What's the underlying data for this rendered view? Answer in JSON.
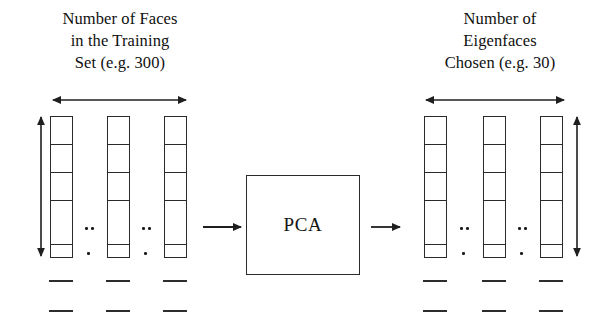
{
  "diagram": {
    "title_left": "Number of Faces in the Training Set (e.g. 300)",
    "title_right": "Number of Eigenfaces Chosen (e.g. 30)",
    "process_label": "PCA",
    "stroke_color": "#2a2a2a",
    "background_color": "#ffffff"
  },
  "caption_left": {
    "line1": "Number of Faces",
    "line2": "in the Training",
    "line3": "Set (e.g. 300)"
  },
  "caption_right": {
    "line1": "Number of",
    "line2": "Eigenfaces",
    "line3": "Chosen (e.g. 30)"
  },
  "pca": {
    "label": "PCA"
  },
  "left_group": {
    "horizontal_arrow_label": "number-of-faces-extent",
    "vertical_arrow_label": "image-vector-length-extent",
    "columns": [
      {
        "name": "face-vector-1",
        "cells": 5
      },
      {
        "name": "face-vector-2",
        "cells": 5
      },
      {
        "name": "face-vector-n",
        "cells": 5
      }
    ],
    "ellipsis_groups": [
      {
        "name": "ellipsis-left-1",
        "double": "..",
        "single": "."
      },
      {
        "name": "ellipsis-left-2",
        "double": "..",
        "single": "."
      }
    ],
    "dash_rows": 2,
    "dashes_per_row": 3
  },
  "right_group": {
    "horizontal_arrow_label": "number-of-eigenfaces-extent",
    "vertical_arrow_label": "eigenvector-length-extent",
    "columns": [
      {
        "name": "eigenface-vector-1",
        "cells": 5
      },
      {
        "name": "eigenface-vector-2",
        "cells": 5
      },
      {
        "name": "eigenface-vector-k",
        "cells": 5
      }
    ],
    "ellipsis_groups": [
      {
        "name": "ellipsis-right-1",
        "double": "..",
        "single": "."
      },
      {
        "name": "ellipsis-right-2",
        "double": "..",
        "single": "."
      }
    ],
    "dash_rows": 2,
    "dashes_per_row": 3
  },
  "flow": {
    "arrow_in": "arrow-into-pca",
    "arrow_out": "arrow-out-of-pca"
  },
  "geometry": {
    "left_columns_x": [
      50,
      107,
      164
    ],
    "right_columns_x": [
      424,
      483,
      540
    ],
    "column_width": 23,
    "column_top": 116,
    "column_bottom": 258,
    "cell_dividers_y": [
      144,
      172,
      200,
      244
    ],
    "dash_rows_y": [
      280,
      310
    ],
    "dash_width": 24,
    "h_arrow_y": 100,
    "left_h_arrow_x": [
      52,
      187
    ],
    "right_h_arrow_x": [
      425,
      565
    ],
    "left_v_arrow_x": 41,
    "right_v_arrow_x": 577,
    "v_arrow_y": [
      115,
      258
    ],
    "flow_arrow_y": 227,
    "pca_box": [
      246,
      175,
      114,
      100
    ]
  }
}
